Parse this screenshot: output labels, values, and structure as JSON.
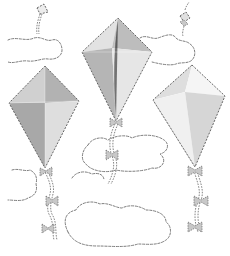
{
  "scene": {
    "title": "Kites among clouds coloring page",
    "background": "#ffffff",
    "colors": {
      "dark_panel": "#a9a9a9",
      "mid_panel": "#c2c2c2",
      "light_panel": "#dcdcdc",
      "pale_panel": "#ececec",
      "white_panel": "#f7f7f7",
      "outline": "#5a5a5a"
    },
    "kites": [
      {
        "name": "left-kite",
        "shade": "dark"
      },
      {
        "name": "middle-kite",
        "shade": "medium"
      },
      {
        "name": "right-kite",
        "shade": "light"
      }
    ],
    "small_kites": [
      {
        "name": "small-kite-left"
      },
      {
        "name": "small-kite-right"
      }
    ],
    "clouds": [
      {
        "name": "cloud-top-left"
      },
      {
        "name": "cloud-top-right"
      },
      {
        "name": "cloud-middle"
      },
      {
        "name": "cloud-bottom-left"
      },
      {
        "name": "cloud-bottom-center"
      }
    ]
  }
}
